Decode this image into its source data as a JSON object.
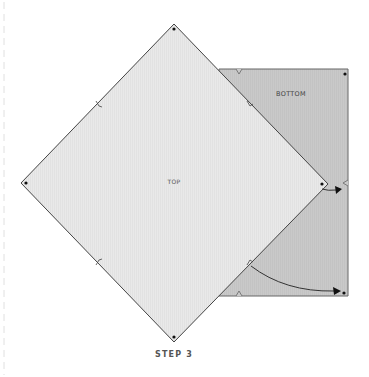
{
  "diagram": {
    "step_label": "STEP 3",
    "top_piece_label": "TOP",
    "bottom_piece_label": "BOTTOM",
    "colors": {
      "top_fill": "#e8e8e8",
      "bottom_fill": "#c6c6c6",
      "outline": "#555555",
      "arrow": "#333333",
      "dot": "#111111",
      "guide_dashed": "#e2e2e2"
    },
    "arrows": [
      {
        "name": "short-fold-arrow",
        "from": "right corner of TOP",
        "to": "right edge of BOTTOM"
      },
      {
        "name": "curved-fold-arrow",
        "from": "lower-right notch of TOP",
        "to": "bottom-right corner of BOTTOM"
      }
    ]
  }
}
